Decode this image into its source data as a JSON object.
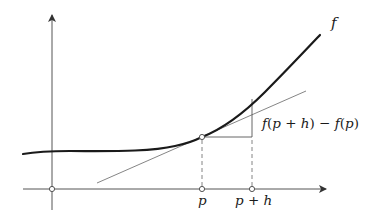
{
  "diagram": {
    "function_label": "f",
    "difference_label": "f(p + h) − f(p)",
    "difference_parts": {
      "f1": "f",
      "open1": "(",
      "p1": "p",
      "plus": " + ",
      "h": "h",
      "close1": ")",
      "minus": " − ",
      "f2": "f",
      "open2": "(",
      "p2": "p",
      "close2": ")"
    },
    "x_tick_labels": {
      "p": "p",
      "p_plus_h_p": "p",
      "p_plus_h_plus": " + ",
      "p_plus_h_h": "h"
    },
    "colors": {
      "curve": "#1a1a1a",
      "axes": "#555555",
      "tangent": "#777777",
      "dashed": "#777777",
      "point_fill": "#ffffff",
      "point_stroke": "#444444"
    }
  }
}
